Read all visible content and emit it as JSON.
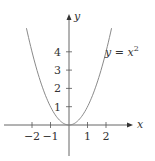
{
  "chart_data": {
    "type": "line",
    "title": "",
    "xlabel": "x",
    "ylabel": "y",
    "curve_label": "y = x²",
    "curve_label_parts": {
      "lhs": "y = x",
      "exp": "2"
    },
    "function": "y = x^2",
    "x": [
      -2.3,
      -2.0,
      -1.5,
      -1.0,
      -0.5,
      0.0,
      0.5,
      1.0,
      1.5,
      2.0,
      2.3
    ],
    "series": [
      {
        "name": "y = x^2",
        "values": [
          5.29,
          4.0,
          2.25,
          1.0,
          0.25,
          0.0,
          0.25,
          1.0,
          2.25,
          4.0,
          5.29
        ]
      }
    ],
    "x_ticks": [
      -2,
      -1,
      1,
      2
    ],
    "x_tick_labels": [
      "−2",
      "−1",
      "1",
      "2"
    ],
    "y_ticks": [
      1,
      2,
      3,
      4
    ],
    "y_tick_labels": [
      "1",
      "2",
      "3",
      "4"
    ],
    "xlim": [
      -3.5,
      3.4
    ],
    "ylim": [
      -1.9,
      5.9
    ],
    "grid": false,
    "legend": "none",
    "colors": {
      "curve": "#8a8a8a",
      "axis": "#555555",
      "text": "#333333"
    }
  }
}
